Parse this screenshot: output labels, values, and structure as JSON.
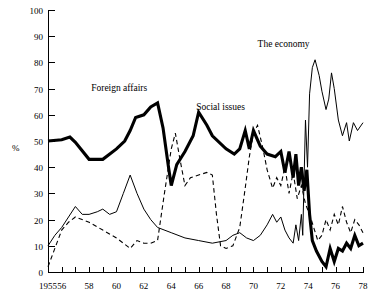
{
  "chart_data": {
    "type": "line",
    "title": "",
    "xlabel": "",
    "ylabel": "%",
    "xlim": [
      1955,
      1978
    ],
    "ylim": [
      0,
      100
    ],
    "grid": false,
    "legend_position": "inline-annotations",
    "x_tick_labels": [
      "1955",
      "56",
      "58",
      "60",
      "62",
      "64",
      "66",
      "68",
      "70",
      "72",
      "74",
      "76",
      "78"
    ],
    "x_tick_values": [
      1955,
      1956,
      1958,
      1960,
      1962,
      1964,
      1966,
      1968,
      1970,
      1972,
      1974,
      1976,
      1978
    ],
    "x_minor_ticks": [
      1955,
      1956,
      1957,
      1958,
      1959,
      1960,
      1961,
      1962,
      1963,
      1964,
      1965,
      1966,
      1967,
      1968,
      1969,
      1970,
      1971,
      1972,
      1973,
      1974,
      1975,
      1976,
      1977,
      1978
    ],
    "y_tick_labels": [
      "0",
      "10",
      "20",
      "30",
      "40",
      "50",
      "60",
      "70",
      "80",
      "90",
      "100"
    ],
    "y_tick_values": [
      0,
      10,
      20,
      30,
      40,
      50,
      60,
      70,
      80,
      90,
      100
    ],
    "x": [
      1955,
      1955.5,
      1956,
      1956.5,
      1957,
      1957.5,
      1958,
      1958.5,
      1959,
      1959.5,
      1960,
      1960.5,
      1961,
      1961.5,
      1962,
      1962.5,
      1963,
      1963.5,
      1964,
      1964.5,
      1965,
      1965.5,
      1966,
      1966.5,
      1967,
      1967.5,
      1968,
      1968.5,
      1969,
      1969.5,
      1970,
      1970.5,
      1971,
      1971.5,
      1972,
      1972.25,
      1972.5,
      1972.75,
      1973,
      1973.25,
      1973.5,
      1973.75,
      1974,
      1974.25,
      1974.5,
      1974.75,
      1975,
      1975.25,
      1975.5,
      1975.75,
      1976,
      1976.25,
      1976.5,
      1976.75,
      1977,
      1977.25,
      1977.5,
      1977.75,
      1978
    ],
    "series": [
      {
        "name": "Foreign affairs",
        "style": "thick-solid",
        "color": "#000000",
        "label_x": 1960.2,
        "label_y": 69,
        "points": [
          [
            1955,
            50
          ],
          [
            1956,
            50.5
          ],
          [
            1956.6,
            51.5
          ],
          [
            1957,
            49.5
          ],
          [
            1958,
            43
          ],
          [
            1959,
            43
          ],
          [
            1960,
            47
          ],
          [
            1960.6,
            50
          ],
          [
            1961,
            54
          ],
          [
            1961.4,
            59
          ],
          [
            1962,
            60
          ],
          [
            1962.5,
            63
          ],
          [
            1963,
            64.5
          ],
          [
            1963.4,
            55
          ],
          [
            1963.8,
            40
          ],
          [
            1964,
            33
          ],
          [
            1964.4,
            41
          ],
          [
            1965,
            46
          ],
          [
            1965.6,
            52
          ],
          [
            1966,
            61
          ],
          [
            1966.6,
            56
          ],
          [
            1967,
            52
          ],
          [
            1968,
            47
          ],
          [
            1968.6,
            45
          ],
          [
            1969,
            47
          ],
          [
            1969.4,
            54
          ],
          [
            1969.7,
            47
          ],
          [
            1970,
            54
          ],
          [
            1970.5,
            48
          ],
          [
            1971,
            45
          ],
          [
            1971.6,
            44
          ],
          [
            1972,
            46
          ],
          [
            1972.3,
            38
          ],
          [
            1972.6,
            46
          ],
          [
            1972.9,
            36
          ],
          [
            1973.1,
            45
          ],
          [
            1973.3,
            33
          ],
          [
            1973.5,
            40
          ],
          [
            1973.7,
            31
          ],
          [
            1973.9,
            39
          ],
          [
            1974.1,
            22
          ],
          [
            1974.3,
            12
          ],
          [
            1974.6,
            8
          ],
          [
            1975,
            4
          ],
          [
            1975.3,
            2
          ],
          [
            1975.6,
            9
          ],
          [
            1975.9,
            4
          ],
          [
            1976.2,
            9
          ],
          [
            1976.5,
            8
          ],
          [
            1976.8,
            11
          ],
          [
            1977.1,
            9
          ],
          [
            1977.4,
            14
          ],
          [
            1977.7,
            10
          ],
          [
            1978,
            11
          ]
        ]
      },
      {
        "name": "The economy",
        "style": "thin-solid",
        "color": "#000000",
        "label_x": 1972.2,
        "label_y": 86,
        "points": [
          [
            1955,
            10
          ],
          [
            1955.5,
            14
          ],
          [
            1956,
            17
          ],
          [
            1956.5,
            21
          ],
          [
            1957,
            25
          ],
          [
            1957.5,
            22
          ],
          [
            1958,
            22
          ],
          [
            1958.6,
            23
          ],
          [
            1959,
            24
          ],
          [
            1959.5,
            22
          ],
          [
            1960,
            23
          ],
          [
            1960.5,
            30
          ],
          [
            1961,
            37
          ],
          [
            1961.5,
            30
          ],
          [
            1962,
            24
          ],
          [
            1962.5,
            20
          ],
          [
            1963,
            17
          ],
          [
            1964,
            15
          ],
          [
            1965,
            13
          ],
          [
            1966,
            12
          ],
          [
            1967,
            11
          ],
          [
            1968,
            12
          ],
          [
            1968.5,
            14
          ],
          [
            1969,
            15
          ],
          [
            1969.5,
            13
          ],
          [
            1970,
            12
          ],
          [
            1970.5,
            14
          ],
          [
            1971,
            18
          ],
          [
            1971.4,
            22
          ],
          [
            1971.7,
            19
          ],
          [
            1972,
            21
          ],
          [
            1972.3,
            16
          ],
          [
            1972.6,
            13
          ],
          [
            1972.9,
            11
          ],
          [
            1973.1,
            18
          ],
          [
            1973.3,
            12
          ],
          [
            1973.5,
            22
          ],
          [
            1973.6,
            14
          ],
          [
            1973.8,
            58
          ],
          [
            1973.95,
            40
          ],
          [
            1974.1,
            68
          ],
          [
            1974.3,
            78
          ],
          [
            1974.5,
            81
          ],
          [
            1974.8,
            75
          ],
          [
            1975,
            69
          ],
          [
            1975.3,
            62
          ],
          [
            1975.5,
            66
          ],
          [
            1975.7,
            76
          ],
          [
            1975.9,
            70
          ],
          [
            1976.2,
            58
          ],
          [
            1976.5,
            52
          ],
          [
            1976.8,
            57
          ],
          [
            1977,
            50
          ],
          [
            1977.3,
            57
          ],
          [
            1977.6,
            54
          ],
          [
            1978,
            57
          ]
        ]
      },
      {
        "name": "Social issues",
        "style": "dashed",
        "color": "#000000",
        "label_x": 1967.6,
        "label_y": 62,
        "points": [
          [
            1955,
            2
          ],
          [
            1955.5,
            9
          ],
          [
            1956,
            16
          ],
          [
            1956.5,
            19
          ],
          [
            1957,
            21
          ],
          [
            1958,
            19
          ],
          [
            1959,
            16
          ],
          [
            1960,
            13
          ],
          [
            1960.5,
            11
          ],
          [
            1961,
            9
          ],
          [
            1961.5,
            12
          ],
          [
            1962,
            11
          ],
          [
            1962.5,
            11
          ],
          [
            1963,
            12
          ],
          [
            1963.5,
            30
          ],
          [
            1964,
            47
          ],
          [
            1964.3,
            53
          ],
          [
            1964.6,
            44
          ],
          [
            1965,
            33
          ],
          [
            1965.4,
            36
          ],
          [
            1966,
            37
          ],
          [
            1966.6,
            38
          ],
          [
            1967,
            37
          ],
          [
            1967.3,
            22
          ],
          [
            1967.6,
            10
          ],
          [
            1968,
            9
          ],
          [
            1968.5,
            10
          ],
          [
            1969,
            17
          ],
          [
            1969.4,
            32
          ],
          [
            1969.7,
            44
          ],
          [
            1970,
            53
          ],
          [
            1970.3,
            56
          ],
          [
            1970.7,
            47
          ],
          [
            1971,
            39
          ],
          [
            1971.4,
            32
          ],
          [
            1971.7,
            36
          ],
          [
            1972,
            33
          ],
          [
            1972.3,
            40
          ],
          [
            1972.6,
            30
          ],
          [
            1972.9,
            38
          ],
          [
            1973.2,
            28
          ],
          [
            1973.5,
            33
          ],
          [
            1973.8,
            26
          ],
          [
            1974.1,
            22
          ],
          [
            1974.4,
            17
          ],
          [
            1974.7,
            12
          ],
          [
            1975,
            14
          ],
          [
            1975.3,
            20
          ],
          [
            1975.6,
            16
          ],
          [
            1975.9,
            22
          ],
          [
            1976.2,
            18
          ],
          [
            1976.5,
            25
          ],
          [
            1976.8,
            19
          ],
          [
            1977.1,
            15
          ],
          [
            1977.4,
            20
          ],
          [
            1977.7,
            18
          ],
          [
            1978,
            15
          ]
        ]
      }
    ]
  }
}
